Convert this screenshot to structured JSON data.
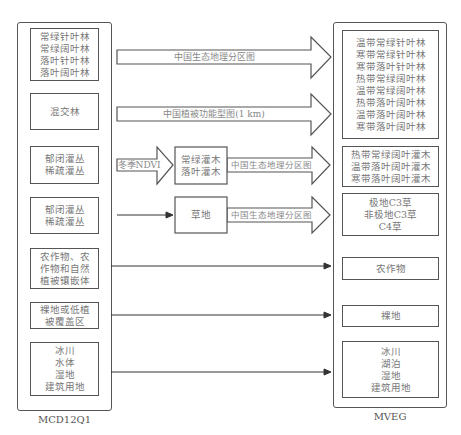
{
  "left_column": {
    "caption": "MCD12Q1",
    "boxes": [
      {
        "text": "常绿针叶林\n常绿阔叶林\n落叶针叶林\n落叶阔叶林"
      },
      {
        "text": "混交林"
      },
      {
        "text": "郁闭灌丛\n稀疏灌丛"
      },
      {
        "text": "郁闭灌丛\n稀疏灌丛"
      },
      {
        "text": "农作物、农\n作物和自然\n植被镶嵌体"
      },
      {
        "text": "裸地或低植\n被覆盖区"
      },
      {
        "text": "冰川\n水体\n湿地\n建筑用地"
      }
    ]
  },
  "middle": {
    "arrow_labels": {
      "forest": "中国生态地理分区图",
      "mixed": "中国植被功能型图(1 km)",
      "ndvi": "冬季NDVI",
      "shrub_zone": "中国生态地理分区图",
      "grass_zone": "中国生态地理分区图"
    },
    "intermediate_boxes": {
      "shrub": "常绿灌木\n落叶灌木",
      "grass": "草地"
    }
  },
  "right_column": {
    "caption": "MVEG",
    "boxes": [
      {
        "text": "温带常绿针叶林\n寒带常绿针叶林\n寒带落叶针叶林\n热带常绿阔叶林\n温带常绿阔叶林\n热带落叶阔叶林\n温带落叶阔叶林\n寒带落叶阔叶林"
      },
      {
        "text": "热带常绿阔叶灌木\n温带落叶阔叶灌木\n寒带落叶阔叶灌木"
      },
      {
        "text": "极地C3草\n非极地C3草\nC4草"
      },
      {
        "text": "农作物"
      },
      {
        "text": "裸地"
      },
      {
        "text": "冰川\n湖泊\n湿地\n建筑用地"
      }
    ]
  },
  "colors": {
    "stroke": "#555555",
    "text": "#777777"
  }
}
